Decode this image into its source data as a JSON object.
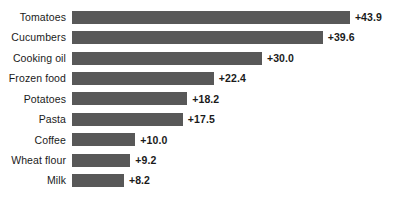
{
  "chart_data": {
    "type": "bar",
    "orientation": "horizontal",
    "title": "",
    "subtitle": "",
    "xlabel": "",
    "ylabel": "",
    "legend": [],
    "legend_position": "none",
    "grid": false,
    "axis_visible": false,
    "xlim": [
      0,
      43.9
    ],
    "categories": [
      "Tomatoes",
      "Cucumbers",
      "Cooking oil",
      "Frozen food",
      "Potatoes",
      "Pasta",
      "Coffee",
      "Wheat flour",
      "Milk"
    ],
    "values": [
      43.9,
      39.6,
      30.0,
      22.4,
      18.2,
      17.5,
      10.0,
      9.2,
      8.2
    ],
    "data_labels": [
      "+43.9",
      "+39.6",
      "+30.0",
      "+22.4",
      "+18.2",
      "+17.5",
      "+10.0",
      "+9.2",
      "+8.2"
    ],
    "bar_color": "#585858",
    "text_color": "#1a1a1a",
    "background_color": "#ffffff"
  }
}
